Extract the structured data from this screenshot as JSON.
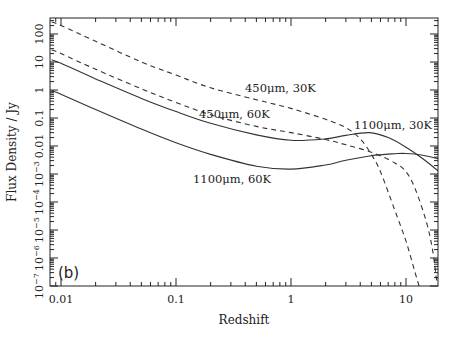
{
  "chart_data": {
    "type": "line",
    "title": "",
    "panel_label": "(b)",
    "xlabel": "Redshift",
    "ylabel": "Flux Density / Jy",
    "xscale": "log",
    "yscale": "log",
    "xlim": [
      0.0083,
      19
    ],
    "ylim": [
      1e-07,
      370
    ],
    "xticks": [
      {
        "value": 0.01,
        "label": "0.01"
      },
      {
        "value": 0.1,
        "label": "0.1"
      },
      {
        "value": 1,
        "label": "1"
      },
      {
        "value": 10,
        "label": "10"
      }
    ],
    "yticks": [
      {
        "value": 1e-07,
        "label": "10",
        "exp": "-7"
      },
      {
        "value": 1e-06,
        "label": "10",
        "exp": "-6"
      },
      {
        "value": 1e-05,
        "label": "10",
        "exp": "-5"
      },
      {
        "value": 0.0001,
        "label": "10",
        "exp": "-4"
      },
      {
        "value": 0.001,
        "label": "10",
        "exp": "-3"
      },
      {
        "value": 0.01,
        "label": "0.01",
        "exp": ""
      },
      {
        "value": 0.1,
        "label": "0.1",
        "exp": ""
      },
      {
        "value": 1,
        "label": "1",
        "exp": ""
      },
      {
        "value": 10,
        "label": "10",
        "exp": ""
      },
      {
        "value": 100,
        "label": "100",
        "exp": ""
      }
    ],
    "grid": false,
    "legend": "inline annotations",
    "series": [
      {
        "name": "450μm, 30K",
        "style": "dashed",
        "label_pos": {
          "x": 245,
          "y": 92
        },
        "points": [
          [
            0.0083,
            270
          ],
          [
            0.01,
            200
          ],
          [
            0.02,
            55
          ],
          [
            0.05,
            10
          ],
          [
            0.1,
            3.4
          ],
          [
            0.2,
            1.2
          ],
          [
            0.5,
            0.45
          ],
          [
            1,
            0.22
          ],
          [
            2,
            0.09
          ],
          [
            3,
            0.045
          ],
          [
            4,
            0.018
          ],
          [
            5,
            0.005
          ],
          [
            6,
            0.0012
          ],
          [
            8,
            5e-05
          ],
          [
            10,
            4e-06
          ],
          [
            12,
            3e-07
          ],
          [
            13,
            1e-07
          ]
        ]
      },
      {
        "name": "450μm, 60K",
        "style": "dashed",
        "label_pos": {
          "x": 199,
          "y": 118
        },
        "points": [
          [
            0.0083,
            27
          ],
          [
            0.01,
            20
          ],
          [
            0.02,
            5.5
          ],
          [
            0.05,
            1.1
          ],
          [
            0.1,
            0.36
          ],
          [
            0.2,
            0.13
          ],
          [
            0.5,
            0.05
          ],
          [
            1,
            0.03
          ],
          [
            2,
            0.017
          ],
          [
            3,
            0.011
          ],
          [
            5,
            0.006
          ],
          [
            8,
            0.0025
          ],
          [
            10,
            0.0012
          ],
          [
            12,
            0.0003
          ],
          [
            15,
            2e-05
          ],
          [
            17,
            2e-06
          ],
          [
            18.5,
            1.5e-07
          ]
        ]
      },
      {
        "name": "1100μm, 30K",
        "style": "solid",
        "label_pos": {
          "x": 354,
          "y": 129
        },
        "points": [
          [
            0.0083,
            12
          ],
          [
            0.01,
            9
          ],
          [
            0.02,
            2.5
          ],
          [
            0.05,
            0.5
          ],
          [
            0.1,
            0.17
          ],
          [
            0.2,
            0.065
          ],
          [
            0.5,
            0.025
          ],
          [
            1,
            0.016
          ],
          [
            2,
            0.018
          ],
          [
            3,
            0.024
          ],
          [
            4.8,
            0.03
          ],
          [
            7,
            0.02
          ],
          [
            10,
            0.009
          ],
          [
            14,
            0.0035
          ],
          [
            19,
            0.0013
          ]
        ]
      },
      {
        "name": "1100μm, 60K",
        "style": "solid",
        "label_pos": {
          "x": 193,
          "y": 183
        },
        "points": [
          [
            0.0083,
            0.95
          ],
          [
            0.01,
            0.7
          ],
          [
            0.02,
            0.2
          ],
          [
            0.05,
            0.04
          ],
          [
            0.1,
            0.013
          ],
          [
            0.2,
            0.005
          ],
          [
            0.5,
            0.0019
          ],
          [
            1,
            0.0015
          ],
          [
            2,
            0.0021
          ],
          [
            3,
            0.0031
          ],
          [
            5,
            0.0045
          ],
          [
            8,
            0.0053
          ],
          [
            10,
            0.0054
          ],
          [
            14,
            0.0047
          ],
          [
            19,
            0.0035
          ]
        ]
      }
    ]
  }
}
